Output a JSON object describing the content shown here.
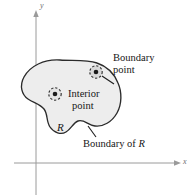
{
  "figure": {
    "background_color": "#ffffff"
  },
  "axes": {
    "x_label": "x",
    "y_label": "y",
    "axis_color": "#8a8a8a",
    "x_axis_y": 163,
    "y_axis_x": 36
  },
  "region": {
    "name_label": "R",
    "fill_color": "#ededed",
    "stroke_color": "#2b2b2b"
  },
  "points": [
    {
      "id": "interior-point",
      "label_line1": "Interior",
      "label_line2": "point",
      "marker": "dashed-circle-with-dot",
      "cx": 55,
      "cy": 94
    },
    {
      "id": "boundary-point",
      "label_line1": "Boundary",
      "label_line2": "point",
      "marker": "dashed-circle-with-dot",
      "cx": 96,
      "cy": 72
    }
  ],
  "callouts": {
    "boundary_point_line1": "Boundary",
    "boundary_point_line2": "point",
    "interior_point_line1": "Interior",
    "interior_point_line2": "point",
    "boundary_of_r_prefix": "Boundary of ",
    "boundary_of_r_symbol": "R"
  }
}
